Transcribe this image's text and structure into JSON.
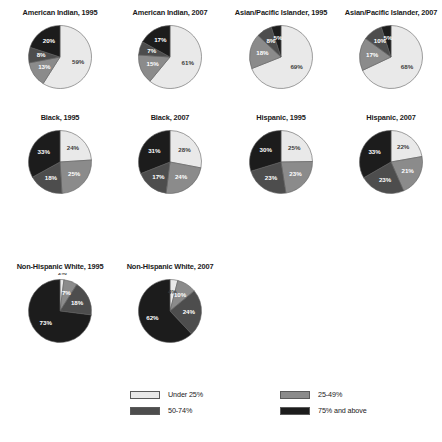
{
  "chart_data": {
    "type": "pie",
    "title": "",
    "legend_position": "bottom",
    "categories": [
      "Under 25%",
      "25-49%",
      "50-74%",
      "75% and above"
    ],
    "colors": [
      "#e9e9e9",
      "#8b8b8b",
      "#4d4d4d",
      "#1c1c1c"
    ],
    "charts": [
      {
        "title": "American Indian, 1995",
        "values": [
          59,
          13,
          8,
          20
        ],
        "labels": [
          "59%",
          "13%",
          "8%",
          "20%"
        ]
      },
      {
        "title": "American Indian, 2007",
        "values": [
          61,
          15,
          7,
          17
        ],
        "labels": [
          "61%",
          "15%",
          "7%",
          "17%"
        ]
      },
      {
        "title": "Asian/Pacific Islander, 1995",
        "values": [
          69,
          18,
          8,
          5
        ],
        "labels": [
          "69%",
          "18%",
          "8%",
          "5%"
        ]
      },
      {
        "title": "Asian/Pacific Islander, 2007",
        "values": [
          68,
          17,
          10,
          5
        ],
        "labels": [
          "68%",
          "17%",
          "10%",
          "5%"
        ]
      },
      {
        "title": "Black, 1995",
        "values": [
          24,
          25,
          18,
          33
        ],
        "labels": [
          "24%",
          "25%",
          "18%",
          "33%"
        ]
      },
      {
        "title": "Black, 2007",
        "values": [
          28,
          24,
          17,
          31
        ],
        "labels": [
          "28%",
          "24%",
          "17%",
          "31%"
        ]
      },
      {
        "title": "Hispanic, 1995",
        "values": [
          25,
          23,
          23,
          30
        ],
        "labels": [
          "25%",
          "23%",
          "23%",
          "30%"
        ]
      },
      {
        "title": "Hispanic, 2007",
        "values": [
          22,
          21,
          23,
          33
        ],
        "labels": [
          "22%",
          "21%",
          "23%",
          "33%"
        ]
      },
      {
        "title": "Non-Hispanic White, 1995",
        "values": [
          2,
          7,
          18,
          73
        ],
        "labels": [
          "2%",
          "7%",
          "18%",
          "73%"
        ]
      },
      {
        "title": "Non-Hispanic White, 2007",
        "values": [
          4,
          10,
          24,
          62
        ],
        "labels": [
          "4%",
          "10%",
          "24%",
          "62%"
        ]
      }
    ]
  },
  "legend": {
    "items": [
      {
        "label": "Under 25%",
        "color": "#e9e9e9"
      },
      {
        "label": "25-49%",
        "color": "#8b8b8b"
      },
      {
        "label": "50-74%",
        "color": "#4d4d4d"
      },
      {
        "label": "75% and above",
        "color": "#1c1c1c"
      }
    ]
  }
}
